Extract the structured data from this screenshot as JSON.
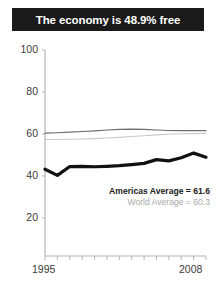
{
  "title": {
    "text": "The economy is 48.9% free"
  },
  "legend": {
    "americas": "Americas Average = 61.6",
    "world": "World Average = 60.3"
  },
  "axes": {
    "y_ticks": [
      "100",
      "80",
      "60",
      "40",
      "20"
    ],
    "x_ticks": [
      "1995",
      "2008"
    ]
  },
  "chart_data": {
    "type": "line",
    "title": "The economy is 48.9% free",
    "xlabel": "",
    "ylabel": "",
    "xlim": [
      1995,
      2008
    ],
    "ylim": [
      20,
      100
    ],
    "yticks": [
      20,
      40,
      60,
      80,
      100
    ],
    "xticks": [
      1995,
      1996,
      1997,
      1998,
      1999,
      2000,
      2001,
      2002,
      2003,
      2004,
      2005,
      2006,
      2007,
      2008
    ],
    "grid": false,
    "legend_position": "inside-right",
    "x": [
      1995,
      1996,
      1997,
      1998,
      1999,
      2000,
      2001,
      2002,
      2003,
      2004,
      2005,
      2006,
      2007,
      2008
    ],
    "series": [
      {
        "name": "Country economic freedom",
        "color": "#111111",
        "width": "bold",
        "values": [
          43.2,
          40.3,
          44.5,
          44.6,
          44.4,
          44.6,
          44.9,
          45.4,
          46.0,
          47.8,
          47.2,
          48.7,
          50.9,
          48.9
        ]
      },
      {
        "name": "Americas Average",
        "color": "#6d6d6d",
        "width": "thin",
        "values": [
          60.4,
          60.6,
          60.9,
          61.2,
          61.5,
          61.9,
          62.2,
          62.3,
          62.2,
          61.9,
          61.7,
          61.6,
          61.6,
          61.6
        ]
      },
      {
        "name": "World Average",
        "color": "#c9c9c9",
        "width": "thin",
        "values": [
          57.4,
          57.4,
          57.5,
          57.6,
          57.8,
          58.1,
          58.4,
          58.8,
          59.2,
          59.6,
          59.9,
          60.1,
          60.2,
          60.3
        ]
      }
    ],
    "annotations": [
      {
        "label": "Americas Average = 61.6",
        "value": 61.6
      },
      {
        "label": "World Average = 60.3",
        "value": 60.3
      }
    ]
  }
}
